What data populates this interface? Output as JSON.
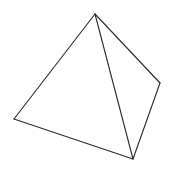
{
  "diagram": {
    "type": "tetrahedron-wireframe",
    "background": "#ffffff",
    "stroke_color": "#2a2a2a",
    "stroke_width": 1.1,
    "vertices": {
      "top": [
        95,
        14
      ],
      "left": [
        14,
        119
      ],
      "bottom": [
        133,
        159
      ],
      "right": [
        160,
        83
      ]
    },
    "edges": [
      [
        "top",
        "left"
      ],
      [
        "left",
        "bottom"
      ],
      [
        "bottom",
        "right"
      ],
      [
        "right",
        "top"
      ],
      [
        "top",
        "bottom"
      ]
    ]
  }
}
